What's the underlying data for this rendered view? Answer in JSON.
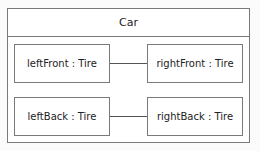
{
  "block": {
    "name": "Car"
  },
  "parts": [
    {
      "label": "leftFront : Tire"
    },
    {
      "label": "rightFront : Tire"
    },
    {
      "label": "leftBack : Tire"
    },
    {
      "label": "rightBack : Tire"
    }
  ],
  "connectors": [
    {
      "from": "leftFront",
      "to": "rightFront"
    },
    {
      "from": "leftBack",
      "to": "rightBack"
    }
  ]
}
